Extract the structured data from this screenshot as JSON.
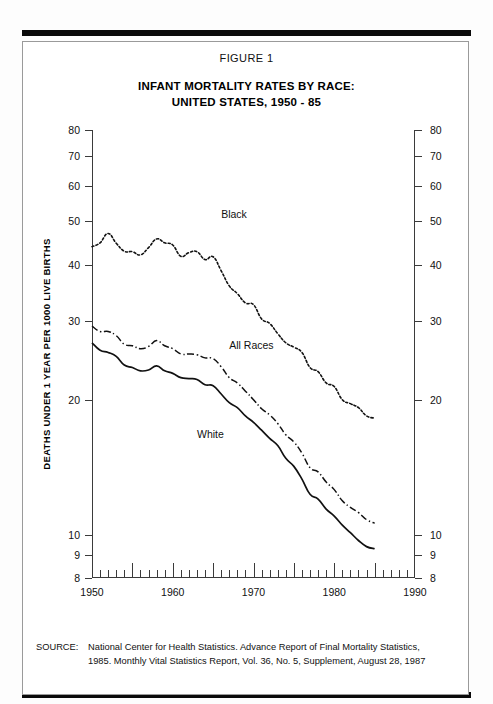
{
  "figure": {
    "label": "FIGURE 1",
    "title_line1": "INFANT MORTALITY RATES BY RACE:",
    "title_line2": "UNITED STATES, 1950 - 85"
  },
  "source": {
    "key": "SOURCE:",
    "line1": "National Center for Health Statistics. Advance Report of Final Mortality Statistics,",
    "line2": "1985. Monthly Vital Statistics Report, Vol. 36, No. 5, Supplement, August 28, 1987"
  },
  "chart_data": {
    "type": "line",
    "title": "INFANT MORTALITY RATES BY RACE: UNITED STATES, 1950 - 85",
    "xlabel": "",
    "ylabel": "DEATHS UNDER 1 YEAR PER 1000 LIVE BIRTHS",
    "yscale": "log",
    "ylim": [
      8,
      80
    ],
    "xlim": [
      1950,
      1990
    ],
    "grid": false,
    "legend_position": "inline-labels",
    "y_ticks": [
      80,
      70,
      60,
      50,
      40,
      30,
      20,
      10,
      9,
      8
    ],
    "y_tick_labels": [
      "80",
      "70",
      "60",
      "50",
      "40",
      "30",
      "20",
      "10",
      "9",
      "8"
    ],
    "x_ticks": [
      1950,
      1960,
      1970,
      1980,
      1990
    ],
    "x_tick_labels": [
      "1950",
      "1960",
      "1970",
      "1980",
      "1990"
    ],
    "x_minor_tick_step": 1,
    "x_major_tick_step": 5,
    "annotations": [
      {
        "text": "Black",
        "x": 1966,
        "y": 52.0
      },
      {
        "text": "All Races",
        "x": 1967,
        "y": 26.5
      },
      {
        "text": "White",
        "x": 1963,
        "y": 16.8
      }
    ],
    "x": [
      1950,
      1951,
      1952,
      1953,
      1954,
      1955,
      1956,
      1957,
      1958,
      1959,
      1960,
      1961,
      1962,
      1963,
      1964,
      1965,
      1966,
      1967,
      1968,
      1969,
      1970,
      1971,
      1972,
      1973,
      1974,
      1975,
      1976,
      1977,
      1978,
      1979,
      1980,
      1981,
      1982,
      1983,
      1984,
      1985
    ],
    "series": [
      {
        "name": "Black",
        "style": "dotted",
        "values": [
          43.9,
          44.8,
          47.0,
          44.7,
          42.9,
          42.8,
          42.1,
          43.7,
          45.7,
          44.8,
          44.3,
          41.8,
          42.6,
          42.8,
          41.1,
          41.7,
          38.8,
          35.9,
          34.5,
          32.9,
          32.6,
          30.3,
          29.6,
          28.1,
          26.8,
          26.2,
          25.5,
          23.6,
          23.1,
          21.8,
          21.4,
          20.0,
          19.6,
          19.2,
          18.4,
          18.2
        ]
      },
      {
        "name": "All Races",
        "style": "dash-dot",
        "values": [
          29.2,
          28.4,
          28.4,
          27.8,
          26.6,
          26.4,
          26.0,
          26.3,
          27.1,
          26.4,
          26.0,
          25.3,
          25.3,
          25.2,
          24.8,
          24.7,
          23.7,
          22.4,
          21.8,
          20.9,
          20.0,
          19.1,
          18.5,
          17.7,
          16.7,
          16.1,
          15.2,
          14.1,
          13.8,
          13.1,
          12.6,
          11.9,
          11.5,
          11.2,
          10.8,
          10.6
        ]
      },
      {
        "name": "White",
        "style": "solid",
        "values": [
          26.8,
          25.8,
          25.5,
          25.0,
          23.9,
          23.6,
          23.2,
          23.3,
          23.8,
          23.2,
          22.9,
          22.4,
          22.3,
          22.2,
          21.6,
          21.5,
          20.6,
          19.7,
          19.2,
          18.4,
          17.8,
          17.1,
          16.4,
          15.8,
          14.8,
          14.2,
          13.3,
          12.3,
          12.0,
          11.4,
          11.0,
          10.5,
          10.1,
          9.7,
          9.4,
          9.3
        ]
      }
    ]
  }
}
